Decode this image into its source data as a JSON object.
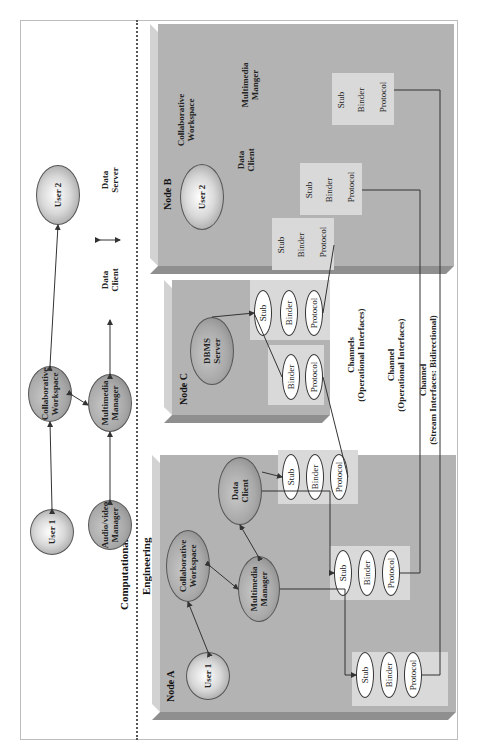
{
  "section_labels": {
    "computational": "Computational",
    "engineering": "Engineering"
  },
  "computational_view": {
    "user1": "User 1",
    "collab_workspace_1": "Collaborative",
    "collab_workspace_2": "Workspace",
    "user2": "User 2",
    "audio_video_1": "Audio/video",
    "audio_video_2": "Manager",
    "multimedia_1": "Multimedia",
    "multimedia_2": "Manager",
    "legend_data_client_1": "Data",
    "legend_data_client_2": "Client",
    "legend_data_server_1": "Data",
    "legend_data_server_2": "Server"
  },
  "node_a": {
    "label": "Node A",
    "user1": "User 1",
    "collab_1": "Collaborative",
    "collab_2": "Workspace",
    "multimedia_1": "Multimedia",
    "multimedia_2": "Manager",
    "data_client_1": "Data",
    "data_client_2": "Client",
    "stacks": [
      {
        "stub": "Stub",
        "binder": "Binder",
        "protocol": "Protocol"
      },
      {
        "stub": "Stub",
        "binder": "Binder",
        "protocol": "Protocol"
      },
      {
        "stub": "Stub",
        "binder": "Binder",
        "protocol": "Protocol"
      }
    ]
  },
  "node_c": {
    "label": "Node C",
    "dbms_1": "DBMS",
    "dbms_2": "Server",
    "stack_top": {
      "stub": "Stub",
      "binder": "Binder",
      "protocol": "Protocol"
    },
    "stack_bottom": {
      "binder": "Binder",
      "protocol": "Protocol"
    }
  },
  "node_b": {
    "label": "Node B",
    "user2": "User 2",
    "collab_1": "Collaborative",
    "collab_2": "Workspace",
    "multimedia_1": "Multimedia",
    "multimedia_2": "Manger",
    "data_client_1": "Data",
    "data_client_2": "Client",
    "stacks": [
      {
        "stub": "Stub",
        "binder": "Binder",
        "protocol": "Protocol"
      },
      {
        "stub": "Stub",
        "binder": "Binder",
        "protocol": "Protocol"
      },
      {
        "stub": "Stub",
        "binder": "Binder",
        "protocol": "Protocol"
      }
    ]
  },
  "channels": {
    "ch1_title": "Channels",
    "ch1_sub": "(Operational Interfaces)",
    "ch2_title": "Channel",
    "ch2_sub": "(Operational Interfaces)",
    "ch3_title": "Channel",
    "ch3_sub": "(Stream Interfaces: Bidirectional)"
  },
  "colors": {
    "node_fill": "#b3b3b3",
    "pad_fill": "#d9d9d9",
    "line": "#333333"
  }
}
